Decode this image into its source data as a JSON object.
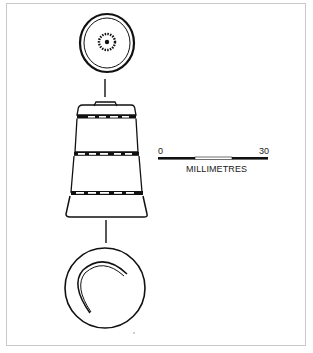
{
  "figure": {
    "views": [
      "top-view",
      "side-profile",
      "bottom-view"
    ]
  },
  "scale_bar": {
    "start_label": "0",
    "end_label": "30",
    "unit_label": "MILLIMETRES",
    "segments": [
      "filled",
      "open",
      "filled"
    ]
  },
  "colors": {
    "ink": "#111111",
    "frame": "#c8c8c8",
    "background": "#ffffff"
  }
}
